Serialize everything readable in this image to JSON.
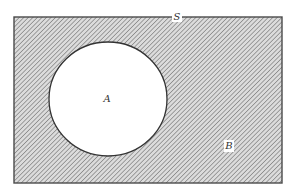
{
  "diagram": {
    "type": "venn",
    "title": "",
    "universe": {
      "label": "S",
      "rect": {
        "x": 14,
        "y": 17,
        "width": 268,
        "height": 166
      },
      "label_pos": {
        "x": 177,
        "y": 20
      }
    },
    "sets": [
      {
        "label": "A",
        "shape": "circle",
        "cx": 108,
        "cy": 99,
        "rx": 59,
        "ry": 57,
        "fill": "#ffffff",
        "label_pos": {
          "x": 107,
          "y": 102
        }
      }
    ],
    "complement": {
      "label": "B",
      "description": "hatched region outside A within S",
      "label_pos": {
        "x": 229,
        "y": 149
      }
    },
    "colors": {
      "hatch_line": "#7a7a7a",
      "hatch_bg": "#d9d9d9",
      "border": "#4a4a4a",
      "circle_stroke": "#333333",
      "background": "#ffffff"
    }
  }
}
